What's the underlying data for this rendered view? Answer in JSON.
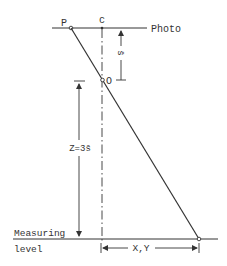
{
  "diagram": {
    "title": "",
    "labels": {
      "photo": "Photo",
      "point_p": "P",
      "point_c": "c",
      "point_o": "O",
      "s_bar": "s̄",
      "z_eq": "Z=3s̄",
      "measuring": "Measuring",
      "level": "level",
      "xy": "X,Y"
    },
    "colors": {
      "line": "#333333",
      "background": "#ffffff"
    }
  }
}
